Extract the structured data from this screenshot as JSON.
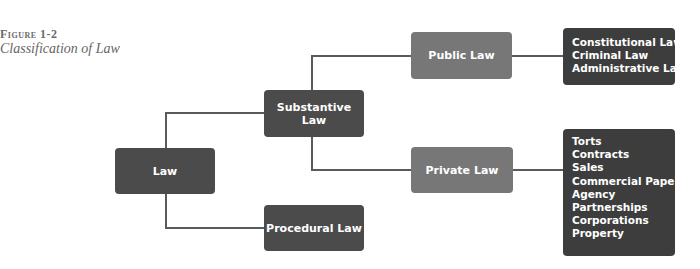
{
  "caption": {
    "figure_label": "Figure 1-2",
    "title": "Classification of Law"
  },
  "nodes": {
    "law": "Law",
    "substantive": "Substantive Law",
    "procedural": "Procedural Law",
    "public": "Public Law",
    "private": "Private Law"
  },
  "public_law_list": [
    "Constitutional Law",
    "Criminal Law",
    "Administrative Law"
  ],
  "private_law_list": [
    "Torts",
    "Contracts",
    "Sales",
    "Commercial Paper",
    "Agency",
    "Partnerships",
    "Corporations",
    "Property"
  ],
  "colors": {
    "dark_node": "#4b4b4b",
    "mid_node": "#777777",
    "list_box": "#3d3d3d",
    "connector": "#5a5a5a"
  }
}
